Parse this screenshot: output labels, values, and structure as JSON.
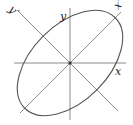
{
  "diagram": {
    "type": "rotated-ellipse-with-axes",
    "center": [
      70,
      63
    ],
    "ellipse": {
      "semi_major": 64,
      "semi_minor": 38,
      "rotation_deg": -45
    },
    "colors": {
      "stroke": "#555555",
      "axis": "#8a8a8a",
      "label": "#222222",
      "background": "#ffffff"
    },
    "labels": {
      "x": "x",
      "y": "y",
      "x_prime": "x′",
      "y_prime": "y′"
    }
  }
}
